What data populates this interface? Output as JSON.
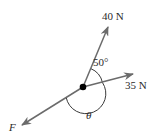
{
  "diagram": {
    "type": "force-vector-diagram",
    "colors": {
      "vector": "#6b6b6b",
      "arc": "#3a3a3a",
      "point": "#000000",
      "text": "#2a2a2a"
    },
    "point": {
      "x": 83,
      "y": 87
    },
    "forces": [
      {
        "id": "force-40n",
        "label": "40 N",
        "tip": {
          "x": 108,
          "y": 27
        }
      },
      {
        "id": "force-35n",
        "label": "35 N",
        "tip": {
          "x": 133,
          "y": 74
        }
      },
      {
        "id": "force-f",
        "label": "F",
        "tip": {
          "x": 22,
          "y": 125
        }
      }
    ],
    "angles": [
      {
        "id": "angle-50",
        "label": "50°"
      },
      {
        "id": "angle-theta",
        "label": "θ"
      }
    ]
  }
}
